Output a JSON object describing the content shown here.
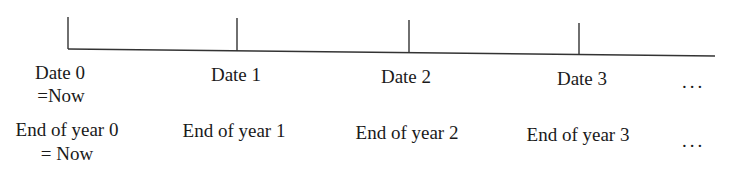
{
  "diagram": {
    "type": "timeline",
    "ticks": [
      {
        "x": 68,
        "date_label": "Date 0",
        "date_note": "=Now",
        "year_label": "End of year 0",
        "year_note": "= Now"
      },
      {
        "x": 237,
        "date_label": "Date 1",
        "date_note": "",
        "year_label": "End of year 1",
        "year_note": ""
      },
      {
        "x": 409,
        "date_label": "Date 2",
        "date_note": "",
        "year_label": "End of year 2",
        "year_note": ""
      },
      {
        "x": 579,
        "date_label": "Date 3",
        "date_note": "",
        "year_label": "End of year 3",
        "year_note": ""
      }
    ],
    "continuation_row1": "...",
    "continuation_row2": "...",
    "line_color": "#333333"
  }
}
